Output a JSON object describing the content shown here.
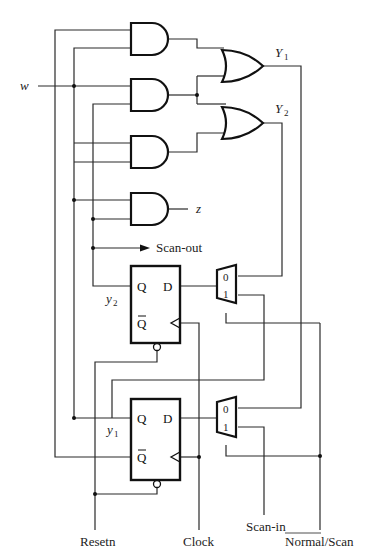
{
  "diagram": {
    "type": "sequential logic circuit with scan chain",
    "inputs": {
      "w": "w",
      "resetn": "Resetn",
      "clock": "Clock",
      "scan_in": "Scan-in",
      "normal_scan": "Normal/Scan"
    },
    "outputs": {
      "Y1": "Y",
      "Y1_sub": "1",
      "Y2": "Y",
      "Y2_sub": "2",
      "z": "z",
      "scan_out": "Scan-out"
    },
    "state_vars": {
      "y2": "y",
      "y2_sub": "2",
      "y1": "y",
      "y1_sub": "1"
    },
    "flipflops": [
      {
        "name": "ff-y2",
        "q": "Q",
        "qbar": "Q",
        "d": "D"
      },
      {
        "name": "ff-y1",
        "q": "Q",
        "qbar": "Q",
        "d": "D"
      }
    ],
    "muxes": [
      {
        "name": "mux-y2",
        "in0": "0",
        "in1": "1"
      },
      {
        "name": "mux-y1",
        "in0": "0",
        "in1": "1"
      }
    ],
    "gates": {
      "and_count": 4,
      "or_count": 2
    }
  }
}
